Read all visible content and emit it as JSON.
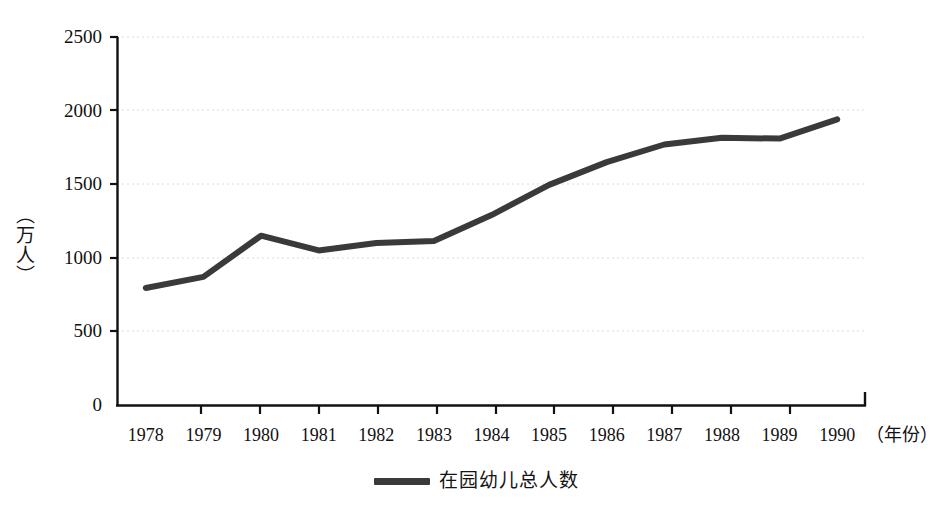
{
  "chart_data": {
    "type": "line",
    "title": "",
    "xlabel": "（年份）",
    "ylabel": "（万人）",
    "categories": [
      "1978",
      "1979",
      "1980",
      "1981",
      "1982",
      "1983",
      "1984",
      "1985",
      "1986",
      "1987",
      "1988",
      "1989",
      "1990"
    ],
    "x": [
      1978,
      1979,
      1980,
      1981,
      1982,
      1983,
      1984,
      1985,
      1986,
      1987,
      1988,
      1989,
      1990
    ],
    "series": [
      {
        "name": "在园幼儿总人数",
        "color": "#3a3a3a",
        "values": [
          795,
          870,
          1150,
          1050,
          1100,
          1115,
          1290,
          1495,
          1650,
          1770,
          1815,
          1810,
          1940
        ]
      }
    ],
    "ylim": [
      0,
      2500
    ],
    "y_ticks": [
      0,
      500,
      1000,
      1500,
      2000,
      2500
    ],
    "y_tick_labels": [
      "0",
      "500",
      "1000",
      "1500",
      "2000",
      "2500"
    ],
    "grid": true,
    "grid_style": "dotted-horizontal",
    "grid_color": "#dcdcdc",
    "legend_position": "bottom-center",
    "axis_color": "#111111",
    "background": "#ffffff"
  },
  "legend": {
    "entries": [
      {
        "label": "在园幼儿总人数",
        "color": "#3a3a3a"
      }
    ]
  },
  "axes": {
    "y_title": "（万人）",
    "x_title": "（年份）"
  }
}
